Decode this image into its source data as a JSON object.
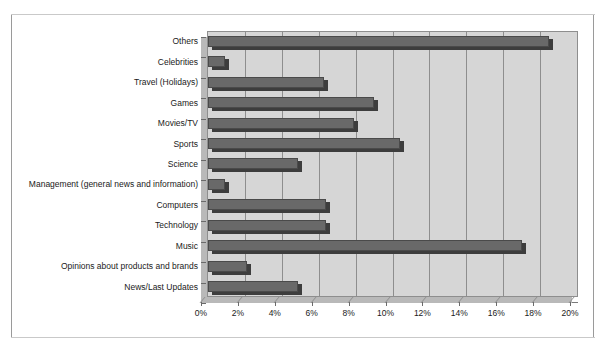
{
  "chart_data": {
    "type": "bar",
    "orientation": "horizontal",
    "title": "",
    "subtitle": "",
    "xlabel": "",
    "ylabel": "",
    "xlim": [
      0,
      20
    ],
    "xunit": "%",
    "grid": true,
    "legend": "none",
    "xticks": [
      "0%",
      "2%",
      "4%",
      "6%",
      "8%",
      "10%",
      "12%",
      "14%",
      "16%",
      "18%",
      "20%"
    ],
    "xtick_values": [
      0,
      2,
      4,
      6,
      8,
      10,
      12,
      14,
      16,
      18,
      20
    ],
    "categories": [
      "Others",
      "Celebrities",
      "Travel (Holidays)",
      "Games",
      "Movies/TV",
      "Sports",
      "Science",
      "Management (general news and information)",
      "Computers",
      "Technology",
      "Music",
      "Opinions about products and brands",
      "News/Last Updates"
    ],
    "values": [
      18.5,
      0.9,
      6.3,
      9.0,
      7.9,
      10.4,
      4.9,
      0.9,
      6.4,
      6.4,
      17.0,
      2.1,
      4.9
    ],
    "series": [
      {
        "name": "Share of topics",
        "values": [
          18.5,
          0.9,
          6.3,
          9.0,
          7.9,
          10.4,
          4.9,
          0.9,
          6.4,
          6.4,
          17.0,
          2.1,
          4.9
        ]
      }
    ],
    "colors": {
      "bar_fill": "#696969",
      "bar_edge": "#4a4a4a",
      "bar_shadow": "#3d3d3d",
      "plot_background": "#d6d6d6",
      "plot_border": "#8e8e8e",
      "gridline": "#8e8e8e",
      "axis": "#7a7a7a",
      "text": "#1a1a1a",
      "page_background": "#ffffff"
    }
  }
}
